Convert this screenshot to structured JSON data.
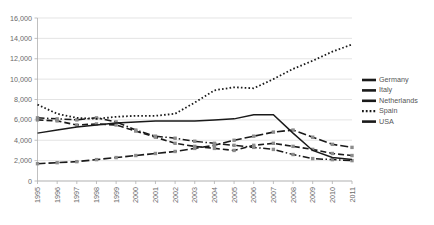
{
  "chart_data": {
    "type": "line",
    "title": "",
    "subtitle": "",
    "xlabel": "",
    "ylabel": "",
    "grid": true,
    "legend_position": "right",
    "xlim": [
      1995,
      2011
    ],
    "ylim": [
      0,
      16000
    ],
    "ytick_interval": 2000,
    "categories": [
      "1995",
      "1996",
      "1997",
      "1998",
      "1999",
      "2000",
      "2001",
      "2002",
      "2003",
      "2004",
      "2005",
      "2006",
      "2007",
      "2008",
      "2009",
      "2010",
      "2011"
    ],
    "ytick_labels": [
      "0",
      "2,000",
      "4,000",
      "6,000",
      "8,000",
      "10,000",
      "12,000",
      "14,000",
      "16,000"
    ],
    "ytick_values": [
      0,
      2000,
      4000,
      6000,
      8000,
      10000,
      12000,
      14000,
      16000
    ],
    "series": [
      {
        "name": "Germany",
        "style": "dashed",
        "color": "#1a1a1a",
        "values": [
          6000,
          5900,
          5500,
          5600,
          5500,
          4900,
          4300,
          3700,
          3400,
          3200,
          3000,
          3500,
          3700,
          3400,
          3100,
          2700,
          2500
        ]
      },
      {
        "name": "Italy",
        "style": "long-dash",
        "color": "#1a1a1a",
        "values": [
          1700,
          1800,
          1900,
          2100,
          2300,
          2500,
          2700,
          2900,
          3200,
          3500,
          4000,
          4400,
          4800,
          5000,
          4300,
          3600,
          3300
        ]
      },
      {
        "name": "Netherlands",
        "style": "dash-dot",
        "color": "#1a1a1a",
        "values": [
          6200,
          6100,
          6000,
          6200,
          5800,
          5000,
          4400,
          4200,
          3900,
          3700,
          3500,
          3300,
          3100,
          2600,
          2200,
          2100,
          2000
        ]
      },
      {
        "name": "Spain",
        "style": "dotted",
        "color": "#1a1a1a",
        "values": [
          7500,
          6600,
          6200,
          6100,
          6300,
          6400,
          6400,
          6600,
          7700,
          8900,
          9200,
          9100,
          10000,
          11000,
          11800,
          12700,
          13400
        ]
      },
      {
        "name": "USA",
        "style": "solid",
        "color": "#1a1a1a",
        "values": [
          4700,
          5000,
          5300,
          5500,
          5700,
          5800,
          5900,
          5900,
          5900,
          6000,
          6100,
          6500,
          6500,
          4700,
          3000,
          2300,
          2100
        ]
      }
    ],
    "spain_dotted_values": [
      7500,
      6600,
      6200,
      6100,
      6300,
      6400,
      6400,
      6600,
      7700,
      8900,
      9200,
      9100,
      10000,
      11000,
      11800,
      12700,
      13400
    ],
    "notes": {
      "spain_peak_year": "2007",
      "spain_peak_value": 14200,
      "usa_peak_year": "2006",
      "usa_peak_value": 6500
    }
  },
  "legend": {
    "items": [
      {
        "label": "Germany"
      },
      {
        "label": "Italy"
      },
      {
        "label": "Netherlands"
      },
      {
        "label": "Spain"
      },
      {
        "label": "USA"
      }
    ]
  }
}
